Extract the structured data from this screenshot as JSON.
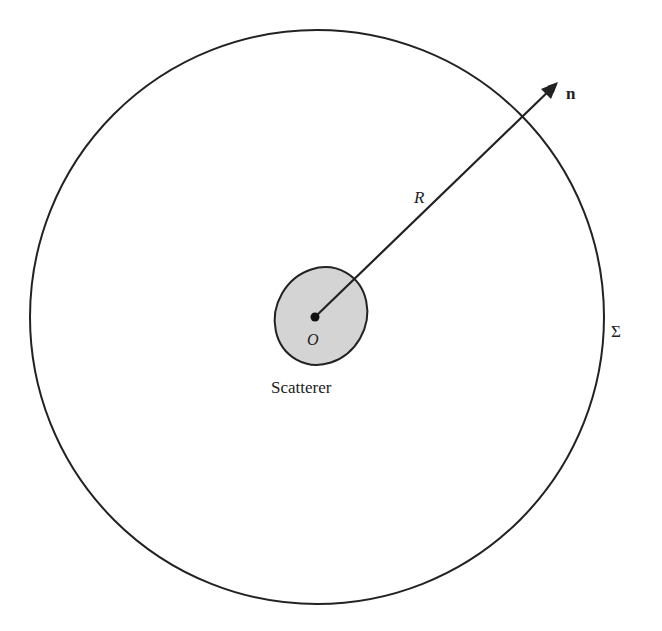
{
  "diagram": {
    "type": "scattering-geometry",
    "labels": {
      "normal": "n",
      "radius": "R",
      "origin": "O",
      "scatterer": "Scatterer",
      "surface": "Σ"
    },
    "colors": {
      "stroke": "#222222",
      "scatterer_fill": "#d4d4d4",
      "background": "#ffffff"
    },
    "geometry": {
      "outer_circle": {
        "cx": 317,
        "cy": 317,
        "r": 287
      },
      "scatterer": {
        "cx": 321,
        "cy": 316,
        "rx": 45,
        "ry": 50,
        "rotate": 30
      },
      "origin_point": {
        "x": 315,
        "y": 317
      },
      "arrow_tip": {
        "x": 558,
        "y": 82
      }
    }
  }
}
